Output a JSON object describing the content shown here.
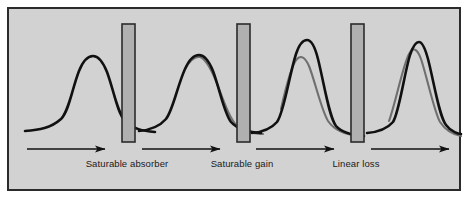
{
  "figure": {
    "panel": {
      "background_color": "#d2d2d2",
      "border_color": "#2b2b2b",
      "outer_background_color": "#ffffff"
    },
    "curve_colors": {
      "primary": "#111111",
      "ghost": "#6f6f6f",
      "element_fill": "#b0b0b0",
      "element_stroke": "#2b2b2b",
      "arrow": "#111111"
    }
  },
  "elements": [
    {
      "name": "saturable-absorber",
      "label": "Saturable absorber",
      "bar_x": 113,
      "bar_y": 15,
      "bar_width": 13,
      "bar_height": 118,
      "label_x": 118,
      "label_y": 155
    },
    {
      "name": "saturable-gain",
      "label": "Saturable gain",
      "bar_x": 228,
      "bar_y": 15,
      "bar_width": 13,
      "bar_height": 118,
      "label_x": 233,
      "label_y": 155
    },
    {
      "name": "linear-loss",
      "label": "Linear loss",
      "bar_x": 342,
      "bar_y": 15,
      "bar_width": 13,
      "bar_height": 118,
      "label_x": 347,
      "label_y": 155
    }
  ],
  "pulses": [
    {
      "name": "pulse-initial",
      "index": 1,
      "description": "broad symmetric pulse before the saturable absorber",
      "has_ghost": false,
      "primary_path": "M 16 122 C 30 121 42 119 52 110 C 60 102 63 80 70 62 C 74 52 79 47 84 47 C 89 47 94 53 98 63 C 105 82 108 103 116 112 C 124 120 134 122 146 123",
      "ghost_path": ""
    },
    {
      "name": "pulse-after-absorber",
      "index": 2,
      "description": "pulse after saturable absorber, wings attenuated, trailing ghost visible",
      "has_ghost": true,
      "primary_path": "M 130 122 C 142 121 150 118 157 110 C 164 101 168 78 176 60 C 180 51 185 46 190 46 C 195 46 200 52 204 62 C 211 81 215 104 222 113 C 229 121 240 123 252 124",
      "ghost_path": "M 176 60 C 181 51 186 47 191 48 C 197 50 202 60 207 72 C 214 90 220 109 228 117 C 235 123 244 124 254 125"
    },
    {
      "name": "pulse-after-gain",
      "index": 3,
      "description": "pulse after saturable gain, sharply amplified peak with lower gray reference pulse",
      "has_ghost": true,
      "primary_path": "M 243 124 C 254 123 262 120 268 113 C 275 104 280 67 287 45 C 290 36 294 31 298 31 C 302 31 306 38 309 50 C 315 74 320 108 327 117 C 333 124 343 126 355 127",
      "ghost_path": "M 272 100 C 276 82 282 56 288 50 C 292 46 296 48 300 57 C 306 72 312 100 319 112 C 326 122 337 126 350 127"
    },
    {
      "name": "pulse-final",
      "index": 4,
      "description": "narrow shaped pulse after linear loss with gray reference pulse",
      "has_ghost": true,
      "primary_path": "M 358 124 C 370 123 378 120 384 113 C 390 104 395 66 401 46 C 404 37 407 33 410 33 C 413 33 416 39 419 50 C 425 73 430 107 437 116 C 442 123 450 125 452 125",
      "ghost_path": "M 380 112 C 386 96 394 56 400 45 C 404 38 408 39 412 50 C 418 68 425 102 431 113 C 437 122 446 126 452 127"
    }
  ],
  "arrows": [
    {
      "name": "arrow-1",
      "x1": 18,
      "x2": 96,
      "y": 140
    },
    {
      "name": "arrow-2",
      "x1": 133,
      "x2": 211,
      "y": 140
    },
    {
      "name": "arrow-3",
      "x1": 247,
      "x2": 325,
      "y": 140
    },
    {
      "name": "arrow-4",
      "x1": 362,
      "x2": 440,
      "y": 140
    }
  ]
}
